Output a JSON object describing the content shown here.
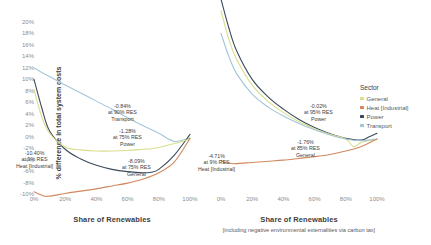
{
  "legend": {
    "title": "Sector",
    "items": [
      {
        "label": "General",
        "color": "#d9de8c"
      },
      {
        "label": "Heat [Industrial]",
        "color": "#d2885f"
      },
      {
        "label": "Power",
        "color": "#3b4a5b"
      },
      {
        "label": "Transport",
        "color": "#a3c6d8"
      }
    ]
  },
  "axes": {
    "ylabel": "% difference in total system costs",
    "yticks": [
      "20%",
      "18%",
      "16%",
      "14%",
      "12%",
      "10%",
      "8%",
      "6%",
      "4%",
      "2%",
      "0%",
      "-2%",
      "-4%",
      "-6%",
      "-8%",
      "-10%"
    ],
    "xticks": [
      "0%",
      "20%",
      "40%",
      "60%",
      "80%",
      "100%"
    ],
    "xlabel_left": "Share of Renewables",
    "xlabel_right": "Share of Renewables",
    "xlabel_right_sub": "[including negative environmental externalities via carbon tax]"
  },
  "annotations_left": [
    {
      "value": "-0.84%",
      "res": "at 90% RES",
      "sector": "Transport",
      "x": 108,
      "y": 103
    },
    {
      "value": "-1.28%",
      "res": "at 75% RES",
      "sector": "Power",
      "x": 113,
      "y": 128
    },
    {
      "value": "-8.09%",
      "res": "at 75% RES",
      "sector": "General",
      "x": 122,
      "y": 158
    },
    {
      "value": "-10.40%",
      "res": "at 9% RES",
      "sector": "Heat [Industrial]",
      "x": 16,
      "y": 150
    }
  ],
  "annotations_right": [
    {
      "value": "-0.02%",
      "res": "at 95% RES",
      "sector": "Power",
      "x": 304,
      "y": 103
    },
    {
      "value": "-1.76%",
      "res": "at 85% RES",
      "sector": "General",
      "x": 291,
      "y": 139
    },
    {
      "value": "-4.71%",
      "res": "at 9% RES",
      "sector": "Heat [Industrial]",
      "x": 198,
      "y": 153
    }
  ],
  "chart_data": {
    "type": "line",
    "panels": [
      {
        "name": "left",
        "title": "",
        "xlabel": "Share of Renewables",
        "ylabel": "% difference in total system costs",
        "xlim": [
          0,
          100
        ],
        "ylim": [
          -10,
          20
        ],
        "grid": false,
        "series": [
          {
            "name": "Transport",
            "color": "#a3c6d8",
            "x": [
              0,
              5,
              10,
              20,
              30,
              40,
              50,
              60,
              70,
              80,
              90,
              100
            ],
            "values": [
              12.0,
              11.2,
              10.5,
              9.0,
              7.6,
              6.2,
              4.8,
              3.3,
              1.9,
              0.6,
              -0.84,
              -0.2
            ],
            "minimum": {
              "x": 90,
              "y": -0.84
            }
          },
          {
            "name": "Power",
            "color": "#3b4a5b",
            "x": [
              0,
              5,
              10,
              20,
              30,
              40,
              50,
              60,
              70,
              75,
              80,
              90,
              100
            ],
            "values": [
              10.0,
              5.0,
              1.0,
              -2.2,
              -3.9,
              -5.0,
              -5.7,
              -6.1,
              -6.3,
              -6.2,
              -5.7,
              -3.2,
              0.4
            ],
            "minimum": {
              "x": 75,
              "y": -1.28
            }
          },
          {
            "name": "General",
            "color": "#d9de8c",
            "x": [
              0,
              5,
              10,
              20,
              30,
              40,
              50,
              60,
              70,
              75,
              80,
              90,
              100
            ],
            "values": [
              8.2,
              3.4,
              0.6,
              -1.8,
              -2.3,
              -2.5,
              -2.5,
              -2.4,
              -2.2,
              -2.1,
              -1.9,
              -1.2,
              -0.4
            ],
            "minimum": {
              "x": 75,
              "y": -8.09
            }
          },
          {
            "name": "Heat [Industrial]",
            "color": "#d2885f",
            "x": [
              0,
              5,
              9,
              20,
              30,
              40,
              50,
              60,
              70,
              80,
              90,
              100
            ],
            "values": [
              -9.6,
              -10.2,
              -10.4,
              -9.9,
              -9.5,
              -9.1,
              -8.6,
              -8.1,
              -7.4,
              -6.3,
              -4.4,
              -0.3
            ],
            "minimum": {
              "x": 9,
              "y": -10.4
            }
          }
        ]
      },
      {
        "name": "right",
        "title": "",
        "xlabel": "Share of Renewables [including negative environmental externalities via carbon tax]",
        "ylabel": "% difference in total system costs",
        "xlim": [
          0,
          100
        ],
        "ylim": [
          -10,
          20
        ],
        "grid": false,
        "series": [
          {
            "name": "Power",
            "color": "#3b4a5b",
            "x": [
              0,
              5,
              10,
              20,
              30,
              40,
              50,
              60,
              70,
              80,
              90,
              95,
              100
            ],
            "values": [
              24.0,
              19.0,
              15.0,
              10.0,
              7.0,
              4.8,
              3.0,
              1.6,
              0.5,
              -0.3,
              -0.6,
              -0.02,
              0.6
            ],
            "minimum": {
              "x": 95,
              "y": -0.02
            }
          },
          {
            "name": "General",
            "color": "#d9de8c",
            "x": [
              0,
              5,
              10,
              20,
              30,
              40,
              50,
              60,
              70,
              80,
              85,
              90,
              100
            ],
            "values": [
              22.0,
              17.0,
              13.5,
              9.0,
              6.2,
              4.2,
              2.6,
              1.4,
              0.4,
              -0.4,
              -1.76,
              -1.0,
              -0.5
            ],
            "minimum": {
              "x": 85,
              "y": -1.76
            }
          },
          {
            "name": "Transport",
            "color": "#a3c6d8",
            "x": [
              0,
              5,
              10,
              20,
              30,
              40,
              50,
              60,
              70,
              80,
              90,
              100
            ],
            "values": [
              18.0,
              14.0,
              11.0,
              7.4,
              5.2,
              3.6,
              2.3,
              1.2,
              0.3,
              -0.4,
              -0.7,
              -0.4
            ],
            "minimum": {
              "x": 90,
              "y": -0.7
            }
          },
          {
            "name": "Heat [Industrial]",
            "color": "#d2885f",
            "x": [
              0,
              5,
              9,
              20,
              30,
              40,
              50,
              60,
              70,
              80,
              90,
              100
            ],
            "values": [
              -4.2,
              -4.6,
              -4.71,
              -4.5,
              -4.3,
              -4.1,
              -3.8,
              -3.5,
              -3.1,
              -2.5,
              -1.7,
              -0.4
            ],
            "minimum": {
              "x": 9,
              "y": -4.71
            }
          }
        ]
      }
    ]
  }
}
